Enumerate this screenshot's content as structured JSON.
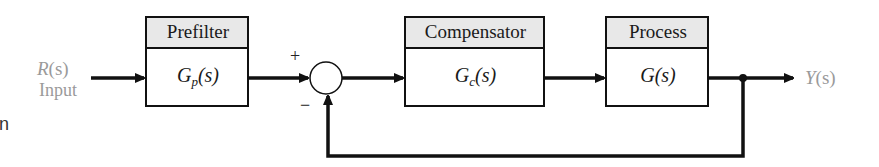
{
  "diagram": {
    "type": "feedback-control-block-diagram",
    "input": {
      "symbol": "R(s)",
      "symbol_var": "R",
      "arg": "(s)",
      "label": "Input"
    },
    "output": {
      "symbol": "Y(s)",
      "symbol_var": "Y",
      "arg": "(s)"
    },
    "blocks": [
      {
        "title": "Prefilter",
        "tf_var": "G",
        "tf_sub": "p",
        "tf_arg": "(s)"
      },
      {
        "title": "Compensator",
        "tf_var": "G",
        "tf_sub": "c",
        "tf_arg": "(s)"
      },
      {
        "title": "Process",
        "tf_var": "G",
        "tf_sub": "",
        "tf_arg": "(s)"
      }
    ],
    "summing_junction": {
      "plus_sign": "+",
      "minus_sign": "−"
    },
    "edge_fragment": "n",
    "colors": {
      "line": "#111111",
      "header_fill": "#e8e8e8",
      "label_gray": "#9a9a9a"
    }
  }
}
